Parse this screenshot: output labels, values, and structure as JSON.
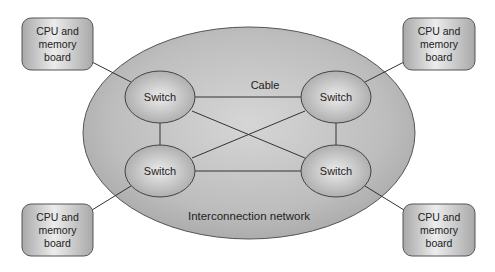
{
  "diagram": {
    "network_label": "Interconnection network",
    "cable_label": "Cable",
    "switches": [
      {
        "id": "sw-tl",
        "label": "Switch",
        "cx": 160,
        "cy": 97
      },
      {
        "id": "sw-tr",
        "label": "Switch",
        "cx": 336,
        "cy": 97
      },
      {
        "id": "sw-bl",
        "label": "Switch",
        "cx": 160,
        "cy": 171
      },
      {
        "id": "sw-br",
        "label": "Switch",
        "cx": 336,
        "cy": 171
      }
    ],
    "boards": [
      {
        "id": "board-tl",
        "lines": [
          "CPU and",
          "memory",
          "board"
        ]
      },
      {
        "id": "board-tr",
        "lines": [
          "CPU and",
          "memory",
          "board"
        ]
      },
      {
        "id": "board-bl",
        "lines": [
          "CPU and",
          "memory",
          "board"
        ]
      },
      {
        "id": "board-br",
        "lines": [
          "CPU and",
          "memory",
          "board"
        ]
      }
    ],
    "colors": {
      "network_fill": "#b5b5b5",
      "switch_fill": "#c8c8c8",
      "board_fill": "#d0d0d0",
      "stroke": "#444444"
    }
  }
}
